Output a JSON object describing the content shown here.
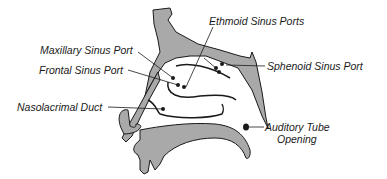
{
  "diagram": {
    "colors": {
      "tissue_fill": "#a9a9a9",
      "outline": "#1a1a1a",
      "background": "#ffffff"
    },
    "labels": [
      {
        "id": "ethmoid",
        "text": "Ethmoid Sinus Ports"
      },
      {
        "id": "maxillary",
        "text": "Maxillary Sinus Port"
      },
      {
        "id": "frontal",
        "text": "Frontal Sinus Port"
      },
      {
        "id": "sphenoid",
        "text": "Sphenoid Sinus Port"
      },
      {
        "id": "nasolacrimal",
        "text": "Nasolacrimal Duct"
      },
      {
        "id": "auditory_line1",
        "text": "Auditory Tube"
      },
      {
        "id": "auditory_line2",
        "text": "Opening"
      }
    ]
  }
}
